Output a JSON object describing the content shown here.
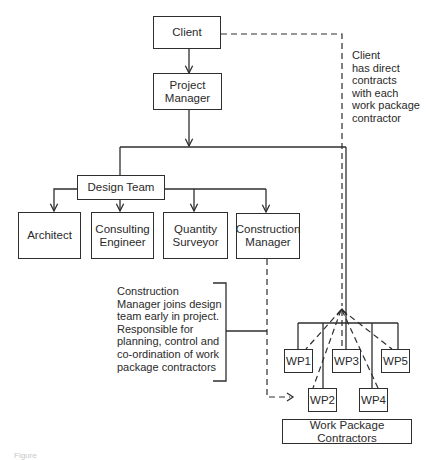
{
  "diagram": {
    "type": "organisation-chart",
    "nodes": {
      "client": "Client",
      "project_manager": "Project\nManager",
      "design_team": "Design Team",
      "architect": "Architect",
      "consulting_engineer": "Consulting\nEngineer",
      "quantity_surveyor": "Quantity\nSurveyor",
      "construction_manager": "Construction\nManager",
      "wp1": "WP1",
      "wp2": "WP2",
      "wp3": "WP3",
      "wp4": "WP4",
      "wp5": "WP5",
      "work_package_contractors": "Work Package Contractors"
    },
    "notes": {
      "client_contracts": "Client\nhas direct\ncontracts\nwith each\nwork package\ncontractor",
      "construction_manager_role": "Construction\nManager joins design\nteam early in project.\nResponsible for\nplanning, control and\nco-ordination of work\npackage contractors"
    },
    "edges": [
      {
        "from": "Client",
        "to": "Project Manager",
        "style": "solid-arrow"
      },
      {
        "from": "Project Manager",
        "to": "Design Team",
        "style": "solid"
      },
      {
        "from": "Project Manager",
        "to": "Work Package Contractors",
        "style": "solid"
      },
      {
        "from": "Design Team",
        "to": "Architect",
        "style": "solid-arrow"
      },
      {
        "from": "Design Team",
        "to": "Consulting Engineer",
        "style": "solid-arrow"
      },
      {
        "from": "Design Team",
        "to": "Quantity Surveyor",
        "style": "solid-arrow"
      },
      {
        "from": "Design Team",
        "to": "Construction Manager",
        "style": "solid-arrow"
      },
      {
        "from": "Client",
        "to": "Work Package Contractors",
        "style": "dashed-arrow"
      },
      {
        "from": "Construction Manager",
        "to": "Work Package Contractors",
        "style": "dashed-arrow"
      }
    ],
    "caption": "Figure"
  }
}
